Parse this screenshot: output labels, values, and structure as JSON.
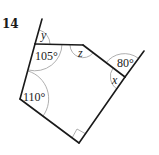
{
  "problem": {
    "number": "14"
  },
  "diagram": {
    "type": "polygon-angles",
    "shape": "pentagon with two extended sides",
    "angle_labels": {
      "y": "y",
      "a105": "105°",
      "z": "z",
      "a80": "80°",
      "x": "x",
      "a110": "110°"
    },
    "right_angle_marker": true,
    "colors": {
      "edge": "#1a1a1a",
      "arc": "#9a9a9a",
      "text": "#222222"
    }
  }
}
